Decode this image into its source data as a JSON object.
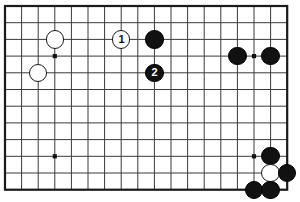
{
  "app": {
    "title": "Go Board Diagram",
    "kind": "go-game-diagram"
  },
  "board": {
    "width_px": 300,
    "height_px": 202,
    "background_color": "#ffffff",
    "line_color": "#3a3a3a",
    "border_color": "#1a1a1a",
    "origin_x": 5,
    "origin_y": 6,
    "spacing_x": 16.6,
    "spacing_y": 16.7,
    "cols": 18,
    "rows": 12,
    "is_partial_view": true,
    "star_point_color": "#111111",
    "star_points": [
      {
        "col": 3,
        "row": 3
      },
      {
        "col": 3,
        "row": 9
      },
      {
        "col": 15,
        "row": 3
      },
      {
        "col": 15,
        "row": 9
      }
    ]
  },
  "stones": [
    {
      "id": "w-a",
      "color": "white",
      "col": 3,
      "row": 2,
      "label": ""
    },
    {
      "id": "w-b",
      "color": "white",
      "col": 2,
      "row": 4,
      "label": ""
    },
    {
      "id": "w-1",
      "color": "white",
      "col": 7,
      "row": 2,
      "label": "1"
    },
    {
      "id": "b-a",
      "color": "black",
      "col": 9,
      "row": 2,
      "label": ""
    },
    {
      "id": "b-2",
      "color": "black",
      "col": 9,
      "row": 4,
      "label": "2"
    },
    {
      "id": "b-c",
      "color": "black",
      "col": 14,
      "row": 3,
      "label": ""
    },
    {
      "id": "b-d",
      "color": "black",
      "col": 16,
      "row": 3,
      "label": ""
    },
    {
      "id": "b-e",
      "color": "black",
      "col": 16,
      "row": 9,
      "label": ""
    },
    {
      "id": "w-c",
      "color": "white",
      "col": 16,
      "row": 10,
      "label": ""
    },
    {
      "id": "b-f",
      "color": "black",
      "col": 17,
      "row": 10,
      "label": ""
    },
    {
      "id": "b-g",
      "color": "black",
      "col": 15,
      "row": 11,
      "label": ""
    },
    {
      "id": "b-h",
      "color": "black",
      "col": 16,
      "row": 11,
      "label": ""
    }
  ],
  "move_numbers": {
    "white_move": "1",
    "black_move": "2"
  },
  "stone_radius_px": 9.2
}
